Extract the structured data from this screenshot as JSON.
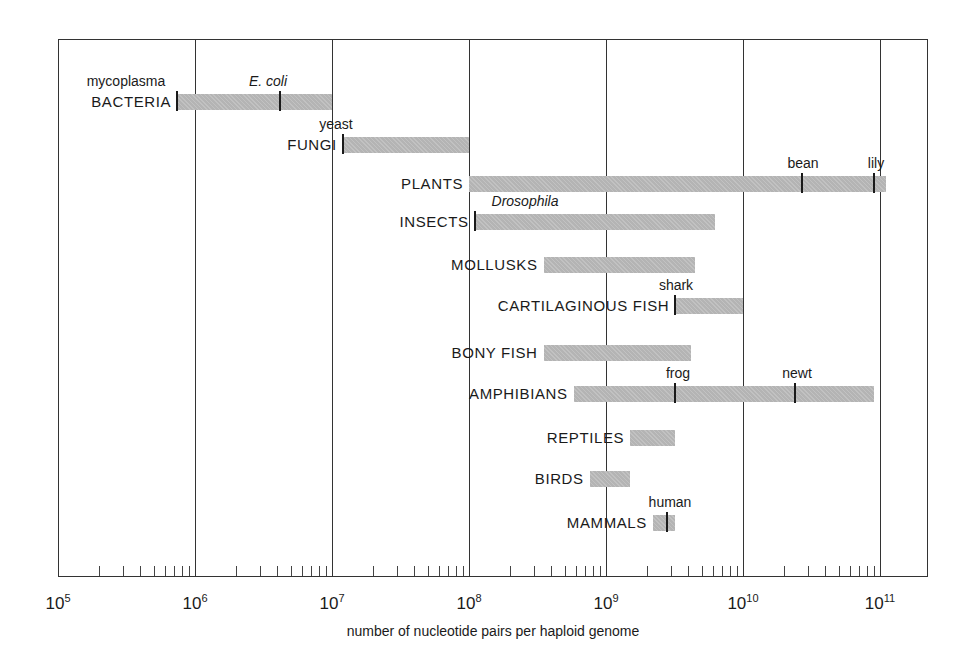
{
  "chart_data": {
    "type": "bar",
    "subtype": "horizontal-range-log",
    "title": "",
    "xlabel": "number of nucleotide pairs per haploid genome",
    "ylabel": "",
    "xscale": "log10",
    "xlim": [
      100000,
      200000000000
    ],
    "grid": true,
    "legend": null,
    "x_ticks": [
      {
        "value": 100000,
        "base": "10",
        "exp": "5"
      },
      {
        "value": 1000000,
        "base": "10",
        "exp": "6"
      },
      {
        "value": 10000000,
        "base": "10",
        "exp": "7"
      },
      {
        "value": 100000000,
        "base": "10",
        "exp": "8"
      },
      {
        "value": 1000000000,
        "base": "10",
        "exp": "9"
      },
      {
        "value": 10000000000,
        "base": "10",
        "exp": "10"
      },
      {
        "value": 100000000000,
        "base": "10",
        "exp": "11"
      }
    ],
    "categories": [
      "BACTERIA",
      "FUNGI",
      "PLANTS",
      "INSECTS",
      "MOLLUSKS",
      "CARTILAGINOUS FISH",
      "BONY FISH",
      "AMPHIBIANS",
      "REPTILES",
      "BIRDS",
      "MAMMALS"
    ],
    "series": [
      {
        "category": "BACTERIA",
        "min": 740000,
        "max": 10000000,
        "y": 102,
        "markers": [
          {
            "label": "mycoplasma",
            "value": 740000,
            "italic": false,
            "lx": 126
          },
          {
            "label": "E. coli",
            "value": 4200000,
            "italic": true,
            "lx": 268
          }
        ]
      },
      {
        "category": "FUNGI",
        "min": 12000000,
        "max": 100000000,
        "y": 145,
        "markers": [
          {
            "label": "yeast",
            "value": 12000000,
            "italic": false,
            "lx": 336
          }
        ]
      },
      {
        "category": "PLANTS",
        "min": 100000000,
        "max": 110000000000,
        "y": 184,
        "markers": [
          {
            "label": "bean",
            "value": 27000000000,
            "italic": false,
            "lx": 803
          },
          {
            "label": "lily",
            "value": 91000000000,
            "italic": false,
            "lx": 876
          }
        ]
      },
      {
        "category": "INSECTS",
        "min": 110000000,
        "max": 6300000000,
        "y": 222,
        "markers": [
          {
            "label": "Drosophila",
            "value": 110000000,
            "italic": true,
            "lx": 525
          }
        ]
      },
      {
        "category": "MOLLUSKS",
        "min": 350000000,
        "max": 4500000000,
        "y": 265,
        "markers": []
      },
      {
        "category": "CARTILAGINOUS FISH",
        "min": 3200000000,
        "max": 10000000000,
        "y": 306,
        "markers": [
          {
            "label": "shark",
            "value": 3200000000,
            "italic": false,
            "lx": 676
          }
        ]
      },
      {
        "category": "BONY FISH",
        "min": 350000000,
        "max": 4200000000,
        "y": 353,
        "markers": []
      },
      {
        "category": "AMPHIBIANS",
        "min": 580000000,
        "max": 91000000000,
        "y": 394,
        "markers": [
          {
            "label": "frog",
            "value": 3200000000,
            "italic": false,
            "lx": 678
          },
          {
            "label": "newt",
            "value": 24000000000,
            "italic": false,
            "lx": 797
          }
        ]
      },
      {
        "category": "REPTILES",
        "min": 1500000000,
        "max": 3200000000,
        "y": 438,
        "markers": []
      },
      {
        "category": "BIRDS",
        "min": 760000000,
        "max": 1500000000,
        "y": 479,
        "markers": []
      },
      {
        "category": "MAMMALS",
        "min": 2200000000,
        "max": 3200000000,
        "y": 523,
        "markers": [
          {
            "label": "human",
            "value": 2800000000,
            "italic": false,
            "lx": 670
          }
        ]
      }
    ]
  },
  "colors": {
    "bar": "#b4b4b4",
    "line": "#333333",
    "text": "#1a1a1a"
  }
}
